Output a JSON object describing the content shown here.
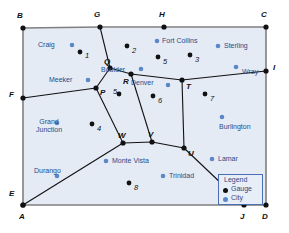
{
  "map": {
    "title": "Colorado rail network with gauges and cities",
    "colors": {
      "region_fill": "#e4ebf5",
      "border": "#7f7f7f",
      "edge": "#111111",
      "gauge_dot": "#111111",
      "city_dot": "#5b87c9",
      "city_text": "#2b4a86",
      "legend_border": "#4a6fb5",
      "legend_fill": "#e8eef7"
    },
    "nodes": [
      {
        "id": "B",
        "label": "B",
        "x": 23,
        "y": 28,
        "lx": 17,
        "ly": 12,
        "on_boundary": true
      },
      {
        "id": "G",
        "label": "G",
        "x": 100,
        "y": 27,
        "lx": 94,
        "ly": 11,
        "on_boundary": true
      },
      {
        "id": "H",
        "label": "H",
        "x": 164,
        "y": 27,
        "lx": 159,
        "ly": 11,
        "on_boundary": true
      },
      {
        "id": "C",
        "label": "C",
        "x": 266,
        "y": 27,
        "lx": 261,
        "ly": 11,
        "on_boundary": true
      },
      {
        "id": "I",
        "label": "I",
        "x": 266,
        "y": 71,
        "lx": 273,
        "ly": 64,
        "on_boundary": true
      },
      {
        "id": "F",
        "label": "F",
        "x": 23,
        "y": 98,
        "lx": 9,
        "ly": 91,
        "on_boundary": true
      },
      {
        "id": "E",
        "label": "E",
        "x": 23,
        "y": 205,
        "lx": 9,
        "ly": 190,
        "on_boundary": true
      },
      {
        "id": "A",
        "label": "A",
        "x": 23,
        "y": 205,
        "lx": 19,
        "ly": 213,
        "on_boundary": true
      },
      {
        "id": "J",
        "label": "J",
        "x": 244,
        "y": 205,
        "lx": 240,
        "ly": 213,
        "on_boundary": true
      },
      {
        "id": "D",
        "label": "D",
        "x": 266,
        "y": 205,
        "lx": 262,
        "ly": 213,
        "on_boundary": true
      },
      {
        "id": "Q",
        "label": "Q",
        "x": 110,
        "y": 68,
        "lx": 104,
        "ly": 58,
        "on_boundary": false
      },
      {
        "id": "R",
        "label": "R",
        "x": 131,
        "y": 74,
        "lx": 123,
        "ly": 78,
        "on_boundary": false
      },
      {
        "id": "P",
        "label": "P",
        "x": 96,
        "y": 88,
        "lx": 100,
        "ly": 89,
        "on_boundary": false
      },
      {
        "id": "T",
        "label": "T",
        "x": 182,
        "y": 80,
        "lx": 186,
        "ly": 83,
        "on_boundary": false
      },
      {
        "id": "W",
        "label": "W",
        "x": 123,
        "y": 143,
        "lx": 118,
        "ly": 132,
        "on_boundary": false
      },
      {
        "id": "V",
        "label": "V",
        "x": 152,
        "y": 142,
        "lx": 148,
        "ly": 131,
        "on_boundary": false
      },
      {
        "id": "U",
        "label": "U",
        "x": 184,
        "y": 148,
        "lx": 188,
        "ly": 150,
        "on_boundary": false
      }
    ],
    "edges": [
      [
        "B",
        "G"
      ],
      [
        "G",
        "H"
      ],
      [
        "H",
        "C"
      ],
      [
        "C",
        "I"
      ],
      [
        "I",
        "D"
      ],
      [
        "B",
        "F"
      ],
      [
        "F",
        "E"
      ],
      [
        "A",
        "J"
      ],
      [
        "J",
        "D"
      ],
      [
        "G",
        "Q"
      ],
      [
        "Q",
        "R"
      ],
      [
        "Q",
        "P"
      ],
      [
        "P",
        "F"
      ],
      [
        "R",
        "T"
      ],
      [
        "T",
        "I"
      ],
      [
        "T",
        "U"
      ],
      [
        "P",
        "W"
      ],
      [
        "R",
        "V"
      ],
      [
        "W",
        "V"
      ],
      [
        "V",
        "U"
      ],
      [
        "W",
        "A"
      ],
      [
        "U",
        "J"
      ]
    ],
    "gauges": [
      {
        "label": "1",
        "x": 80,
        "y": 52,
        "lx": 85,
        "ly": 52
      },
      {
        "label": "2",
        "x": 127,
        "y": 46,
        "lx": 132,
        "ly": 47
      },
      {
        "label": "3",
        "x": 190,
        "y": 55,
        "lx": 195,
        "ly": 56
      },
      {
        "label": "4",
        "x": 92,
        "y": 124,
        "lx": 97,
        "ly": 125
      },
      {
        "label": "5",
        "x": 119,
        "y": 94,
        "lx": 113,
        "ly": 88
      },
      {
        "label": "5",
        "x": 158,
        "y": 57,
        "lx": 163,
        "ly": 58
      },
      {
        "label": "6",
        "x": 153,
        "y": 96,
        "lx": 158,
        "ly": 97
      },
      {
        "label": "7",
        "x": 205,
        "y": 94,
        "lx": 210,
        "ly": 95
      },
      {
        "label": "8",
        "x": 129,
        "y": 183,
        "lx": 134,
        "ly": 184
      }
    ],
    "cities": [
      {
        "name": "Craig",
        "x": 72,
        "y": 45,
        "lx": 38,
        "ly": 41
      },
      {
        "name": "Meeker",
        "x": 88,
        "y": 80,
        "lx": 49,
        "ly": 76
      },
      {
        "name": "Fort Collins",
        "x": 157,
        "y": 41,
        "lx": 162,
        "ly": 37
      },
      {
        "name": "Sterling",
        "x": 218,
        "y": 46,
        "lx": 224,
        "ly": 42
      },
      {
        "name": "Boulder",
        "x": 141,
        "y": 69,
        "lx": 101,
        "ly": 66
      },
      {
        "name": "Denver",
        "x": 168,
        "y": 85,
        "lx": 131,
        "ly": 79
      },
      {
        "name": "Wray",
        "x": 236,
        "y": 67,
        "lx": 242,
        "ly": 68
      },
      {
        "name": "Burlington",
        "x": 222,
        "y": 117,
        "lx": 219,
        "ly": 123
      },
      {
        "name": "Grand Junction",
        "x": 57,
        "y": 123,
        "lx": 44,
        "ly": 118
      },
      {
        "name": "Durango",
        "x": 57,
        "y": 176,
        "lx": 34,
        "ly": 167
      },
      {
        "name": "Monte Vista",
        "x": 106,
        "y": 161,
        "lx": 112,
        "ly": 157
      },
      {
        "name": "Trinidad",
        "x": 163,
        "y": 176,
        "lx": 169,
        "ly": 172
      },
      {
        "name": "Lamar",
        "x": 212,
        "y": 159,
        "lx": 218,
        "ly": 155
      }
    ],
    "legend": {
      "title": "Legend",
      "items": [
        {
          "label": "Gauge",
          "type": "gauge"
        },
        {
          "label": "City",
          "type": "city"
        }
      ]
    }
  }
}
